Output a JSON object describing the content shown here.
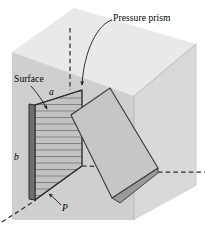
{
  "figure": {
    "title_label": "Pressure prism",
    "surface_label": "Surface",
    "dimension_width_label": "a",
    "dimension_height_label": "b",
    "pressure_label": "P",
    "colors": {
      "box_top_face": "#e9e9e9",
      "box_front_face": "#cfcfcf",
      "box_right_face": "#d9d9d9",
      "prism_face": "#c6c6c6",
      "prism_side_face": "#9a9a9a",
      "surface_edge": "#6f6f6f",
      "hatch_fill": "#c2c2c2",
      "line": "#3a3a3a",
      "text": "#000000",
      "page_background": "#ffffff"
    }
  },
  "geometry": {
    "box": {
      "top_face": "12,52 74,8 196,44 134,96",
      "front_face": "12,52 134,96 134,220 12,220",
      "right_face": "134,96 196,44 196,186 134,220"
    },
    "dashed_lines": [
      {
        "name": "vertical-construction-line",
        "x1": 70,
        "y1": 28,
        "x2": 70,
        "y2": 90
      },
      {
        "name": "bottom-left-diagonal-line",
        "x1": 2,
        "y1": 222,
        "x2": 36,
        "y2": 200
      },
      {
        "name": "right-horizontal-line",
        "x1": 158,
        "y1": 172,
        "x2": 205,
        "y2": 172
      },
      {
        "name": "inner-horizontal-line",
        "x1": 82,
        "y1": 166,
        "x2": 158,
        "y2": 168
      }
    ],
    "surface": {
      "hatched_face": "35,105 82,90 82,166 35,200",
      "dark_edge": "30,104 35,105 35,200 30,199",
      "hatch_line_count": 13
    },
    "prism": {
      "front_face": "71,115 110,88 158,168 112,198",
      "side_face": "158,168 112,198 120,202 158,172",
      "top_edge": "71,115 110,88"
    },
    "leaders": [
      {
        "name": "pressure-prism-leader",
        "path": "M 112,20 C 98,24 84,50 82,86",
        "arrow_at": "82,90"
      },
      {
        "name": "surface-leader",
        "path": "M 30,86 C 36,92 42,100 47,110",
        "arrow_at": "48,112"
      },
      {
        "name": "pressure-P-leader",
        "path": "M 60,204 C 56,200 52,196 47,193",
        "arrow_at": "46,192"
      }
    ]
  }
}
